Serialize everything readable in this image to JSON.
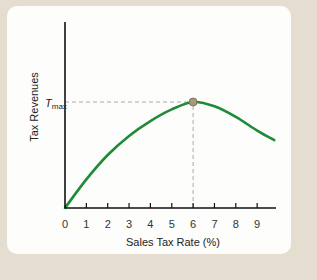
{
  "chart_data": {
    "type": "line",
    "title": "",
    "xlabel": "Sales Tax Rate (%)",
    "ylabel": "Tax Revenues",
    "x_ticks": [
      "0",
      "1",
      "2",
      "3",
      "4",
      "5",
      "6",
      "7",
      "8",
      "9"
    ],
    "xlim": [
      0,
      10
    ],
    "ylim": [
      0,
      1
    ],
    "grid": false,
    "legend": "none",
    "series": [
      {
        "name": "Tax revenue (Laffer curve)",
        "color": "#1f8a3a",
        "x": [
          0,
          1,
          2,
          3,
          4,
          5,
          6,
          7,
          8,
          9,
          9.8
        ],
        "y": [
          0,
          0.27,
          0.5,
          0.68,
          0.82,
          0.93,
          1.0,
          0.96,
          0.86,
          0.73,
          0.64
        ]
      }
    ],
    "annotations": [
      {
        "type": "point",
        "x": 6,
        "y": 1.0,
        "label": "T_max"
      },
      {
        "type": "dashed-line",
        "from": [
          0,
          1.0
        ],
        "to": [
          6,
          1.0
        ]
      },
      {
        "type": "dashed-line",
        "from": [
          6,
          0
        ],
        "to": [
          6,
          1.0
        ]
      }
    ],
    "peak_label_main": "T",
    "peak_label_sub": "max"
  },
  "colors": {
    "background": "#e5ddd0",
    "panel": "#fdfdfc",
    "curve": "#1f8a3a",
    "axis": "#111111",
    "dashed": "#aaaaaa",
    "marker": "#a89a78"
  }
}
